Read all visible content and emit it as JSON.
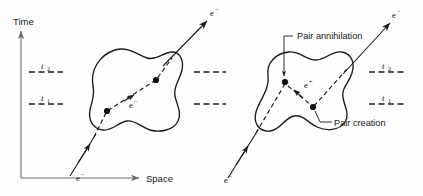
{
  "figure": {
    "title_alt": "Spacetime diagram of electron worldline with pair creation and pair annihilation",
    "background_color": "#fefefe",
    "ink_color": "#1a1a1a"
  },
  "axes": {
    "time_label": "Time",
    "space_label": "Space",
    "time_arrow_name": "time-axis-arrow",
    "space_arrow_name": "space-axis-arrow"
  },
  "time_markers": [
    {
      "label": "t",
      "subscript": "2",
      "y": 72
    },
    {
      "label": "t",
      "subscript": "1",
      "y": 104
    }
  ],
  "panels": [
    {
      "id": "left-panel",
      "caption": "",
      "incoming_particle": "e",
      "incoming_superscript": "−",
      "outgoing_particle": "e",
      "outgoing_superscript": "−",
      "internal_particle": "e",
      "internal_superscript": "−",
      "vertices": 2
    },
    {
      "id": "right-panel",
      "caption": "",
      "incoming_particle": "e",
      "incoming_superscript": "−",
      "outgoing_particle": "e",
      "outgoing_superscript": "−",
      "internal_particle": "e",
      "internal_superscript": "+",
      "vertices": 2
    }
  ],
  "callouts": [
    {
      "text": "Pair annihilation",
      "name": "pair-annihilation-callout"
    },
    {
      "text": "Pair creation",
      "name": "pair-creation-callout"
    }
  ],
  "particle_labels": {
    "electron": "e",
    "electron_sup": "−",
    "positron": "e",
    "positron_sup": "+"
  }
}
